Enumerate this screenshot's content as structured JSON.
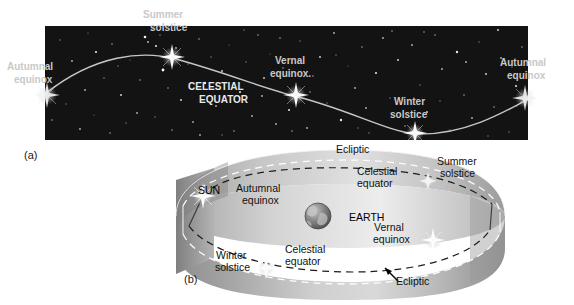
{
  "figure": {
    "title_hidden": "",
    "panels": [
      {
        "id": "a",
        "letter": "(a)"
      },
      {
        "id": "b",
        "letter": "(b)"
      }
    ]
  },
  "sky_panel": {
    "name": "celestial-sphere-starfield",
    "background_color": "#141414",
    "curve_color": "#dcdcdc",
    "label_color": "#c9c9c9",
    "equator_text_color": "#e8e8e8",
    "labels": {
      "autumnal_equinox_left_line1": "Autumnal",
      "autumnal_equinox_left_line2": "equinox",
      "summer_solstice_line1": "Summer",
      "summer_solstice_line2": "solstice",
      "vernal_equinox_line1": "Vernal",
      "vernal_equinox_line2": "equinox.",
      "winter_solstice_line1": "Winter",
      "winter_solstice_line2": "solstice",
      "autumnal_equinox_right_line1": "Autumnal",
      "autumnal_equinox_right_line2": "equinox",
      "celestial_equator_line1": "CELESTIAL",
      "celestial_equator_line2": "EQUATOR"
    },
    "markers": [
      {
        "name": "autumnal-equinox-left",
        "x": 47,
        "y": 95
      },
      {
        "name": "summer-solstice",
        "x": 172,
        "y": 57
      },
      {
        "name": "vernal-equinox",
        "x": 296,
        "y": 95
      },
      {
        "name": "winter-solstice",
        "x": 415,
        "y": 133
      },
      {
        "name": "autumnal-equinox-right",
        "x": 525,
        "y": 98
      }
    ]
  },
  "band_panel": {
    "name": "ecliptic-band-3d",
    "labels": {
      "ecliptic_top": "Ecliptic",
      "celestial_top_line1": "Celestial",
      "celestial_top_line2": "equator",
      "summer_solstice_line1": "Summer",
      "summer_solstice_line2": "solstice",
      "sun": "SUN",
      "autumnal_equinox_line1": "Autumnal",
      "autumnal_equinox_line2": "equinox",
      "earth": "EARTH",
      "vernal_equinox_line1": "Vernal",
      "vernal_equinox_line2": "equinox",
      "celestial_bottom_line1": "Celestial",
      "celestial_bottom_line2": "equator",
      "winter_solstice_line1": "Winter",
      "winter_solstice_line2": "solstice",
      "ecliptic_bottom": "Ecliptic"
    },
    "earth": {
      "name": "earth-globe",
      "x": 318,
      "y": 216,
      "r": 13
    },
    "sun_marker": {
      "name": "sun-marker",
      "x": 203,
      "y": 196
    },
    "colors": {
      "band_light": "#e3e3e3",
      "band_mid": "#bdbdbd",
      "band_dark": "#8f8f8f",
      "dashed_dark": "#222222",
      "dashed_light": "#ffffff",
      "earth_ocean": "#7a7a7a",
      "earth_land": "#b9b9b9"
    }
  },
  "edge_caption": {
    "name": "figure-caption-fragment",
    "lines": [
      "",
      "",
      "",
      "",
      ""
    ]
  }
}
